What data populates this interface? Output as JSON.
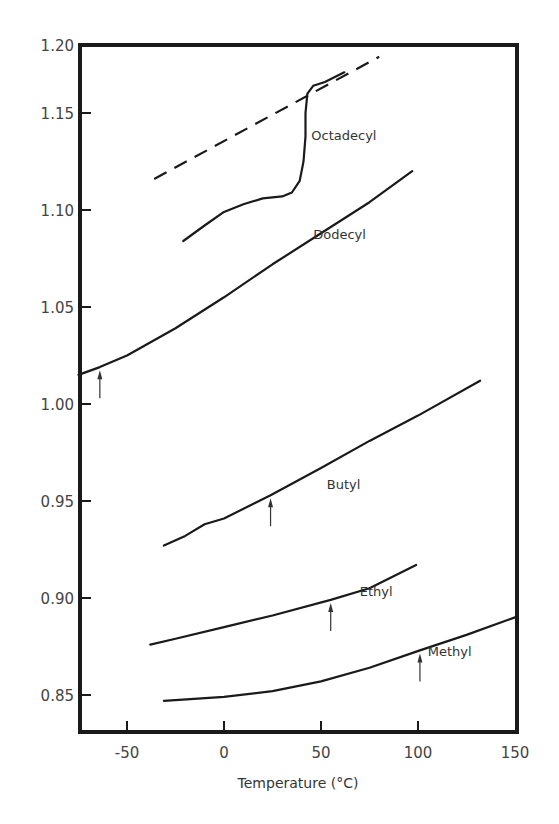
{
  "chart_data": {
    "type": "line",
    "title": "",
    "xlabel": "Temperature (°C)",
    "ylabel": "",
    "xlim": [
      -75,
      150
    ],
    "ylim": [
      0.831,
      1.185
    ],
    "xticks": [
      -50,
      0,
      50,
      100,
      150
    ],
    "xtick_labels": [
      "-50",
      "0",
      "50",
      "100",
      "150"
    ],
    "yticks": [
      0.85,
      0.9,
      0.95,
      1.0,
      1.05,
      1.1,
      1.15,
      1.2
    ],
    "ytick_labels": [
      "0.85",
      "0.90",
      "0.95",
      "1.00",
      "1.05",
      "1.10",
      "1.15",
      "1.20"
    ],
    "grid": false,
    "legend": "none (inline series labels)",
    "series": [
      {
        "name": "Octadecyl",
        "style": "solid",
        "x": [
          -21,
          -10,
          0,
          10,
          20,
          30,
          35,
          39,
          41,
          42,
          42,
          43,
          46,
          52,
          62
        ],
        "y": [
          1.084,
          1.092,
          1.099,
          1.103,
          1.106,
          1.107,
          1.109,
          1.115,
          1.125,
          1.138,
          1.15,
          1.16,
          1.164,
          1.166,
          1.171
        ]
      },
      {
        "name": "Octadecyl (extrapolated)",
        "style": "dashed",
        "x": [
          -36,
          80
        ],
        "y": [
          1.116,
          1.179
        ]
      },
      {
        "name": "Dodecyl",
        "style": "solid",
        "x": [
          -75,
          -64,
          -50,
          -25,
          0,
          25,
          50,
          75,
          97
        ],
        "y": [
          1.015,
          1.019,
          1.025,
          1.039,
          1.055,
          1.072,
          1.088,
          1.104,
          1.12
        ]
      },
      {
        "name": "Butyl",
        "style": "solid",
        "x": [
          -31,
          -20,
          -10,
          0,
          24,
          50,
          75,
          100,
          132
        ],
        "y": [
          0.927,
          0.932,
          0.938,
          0.941,
          0.953,
          0.967,
          0.981,
          0.994,
          1.012
        ]
      },
      {
        "name": "Ethyl",
        "style": "solid",
        "x": [
          -38,
          -25,
          0,
          25,
          55,
          75,
          99
        ],
        "y": [
          0.876,
          0.879,
          0.885,
          0.891,
          0.899,
          0.905,
          0.917
        ]
      },
      {
        "name": "Methyl",
        "style": "solid",
        "x": [
          -31,
          0,
          25,
          50,
          75,
          101,
          125,
          150
        ],
        "y": [
          0.847,
          0.849,
          0.852,
          0.857,
          0.864,
          0.873,
          0.881,
          0.89
        ]
      }
    ],
    "annotations": [
      {
        "type": "arrow",
        "series": "Dodecyl",
        "x": -64,
        "y": 1.019,
        "label": "transition marker"
      },
      {
        "type": "arrow",
        "series": "Butyl",
        "x": 24,
        "y": 0.953,
        "label": "transition marker"
      },
      {
        "type": "arrow",
        "series": "Ethyl",
        "x": 55,
        "y": 0.899,
        "label": "transition marker"
      },
      {
        "type": "arrow",
        "series": "Methyl",
        "x": 101,
        "y": 0.873,
        "label": "transition marker"
      }
    ],
    "series_labels": [
      {
        "text": "Octadecyl",
        "x": 45,
        "y": 1.136
      },
      {
        "text": "Dodecyl",
        "x": 46,
        "y": 1.085
      },
      {
        "text": "Butyl",
        "x": 53,
        "y": 0.956
      },
      {
        "text": "Ethyl",
        "x": 70,
        "y": 0.901
      },
      {
        "text": "Methyl",
        "x": 105,
        "y": 0.87
      }
    ]
  }
}
